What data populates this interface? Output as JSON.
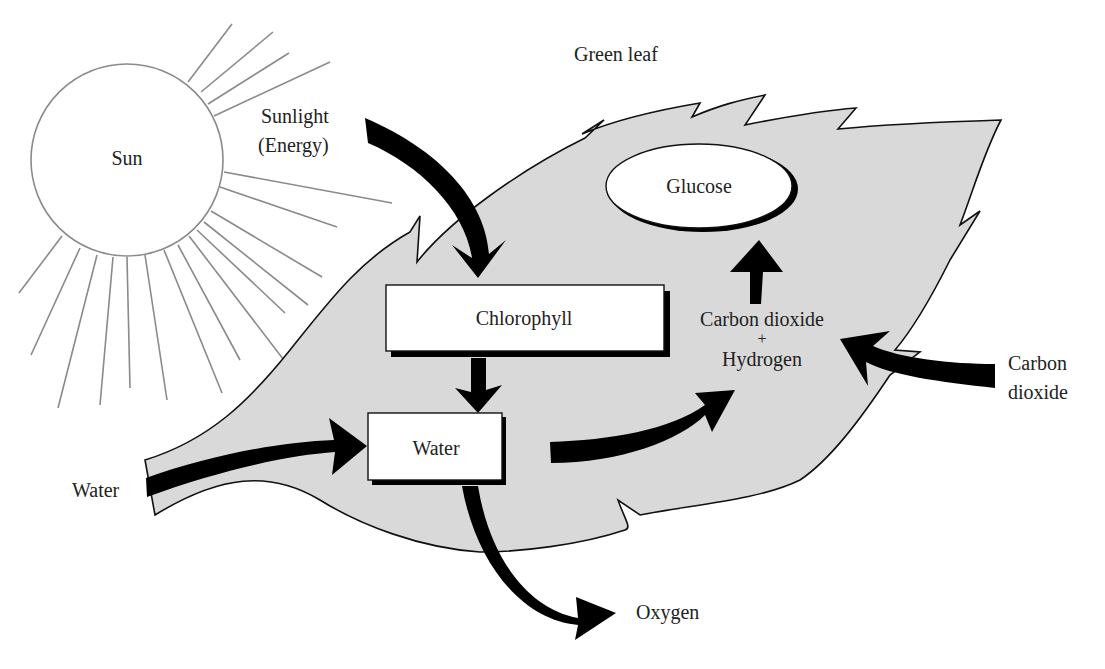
{
  "diagram": {
    "colors": {
      "leaf_fill": "#d9d9d9",
      "outline": "#111111",
      "arrow": "#000000",
      "ray": "#8a8a8a",
      "box_fill": "#ffffff"
    },
    "labels": {
      "sun": "Sun",
      "sunlight_line1": "Sunlight",
      "sunlight_line2": "(Energy)",
      "green_leaf": "Green leaf",
      "glucose": "Glucose",
      "chlorophyll": "Chlorophyll",
      "co2_h_line1": "Carbon dioxide",
      "co2_h_plus": "+",
      "co2_h_line2": "Hydrogen",
      "carbon_dioxide_line1": "Carbon",
      "carbon_dioxide_line2": "dioxide",
      "water_box": "Water",
      "water_input": "Water",
      "oxygen": "Oxygen"
    },
    "nodes": [
      {
        "id": "sun",
        "label": "Sun",
        "shape": "circle"
      },
      {
        "id": "chlorophyll",
        "label": "Chlorophyll",
        "shape": "box"
      },
      {
        "id": "water_box",
        "label": "Water",
        "shape": "box"
      },
      {
        "id": "glucose",
        "label": "Glucose",
        "shape": "ellipse"
      },
      {
        "id": "co2_h",
        "label": "Carbon dioxide + Hydrogen",
        "shape": "text"
      },
      {
        "id": "co2_in",
        "label": "Carbon dioxide",
        "shape": "text"
      },
      {
        "id": "water_in",
        "label": "Water",
        "shape": "text"
      },
      {
        "id": "oxygen",
        "label": "Oxygen",
        "shape": "text"
      }
    ],
    "edges": [
      {
        "from": "Sunlight (Energy)",
        "to": "Chlorophyll"
      },
      {
        "from": "Chlorophyll",
        "to": "Water"
      },
      {
        "from": "Water (input)",
        "to": "Water"
      },
      {
        "from": "Water",
        "to": "Carbon dioxide + Hydrogen"
      },
      {
        "from": "Water",
        "to": "Oxygen"
      },
      {
        "from": "Carbon dioxide (input)",
        "to": "Carbon dioxide + Hydrogen"
      },
      {
        "from": "Carbon dioxide + Hydrogen",
        "to": "Glucose"
      }
    ]
  }
}
